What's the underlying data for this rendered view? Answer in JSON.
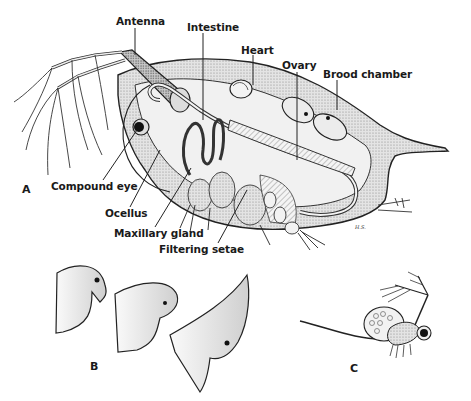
{
  "figure": {
    "panels": [
      {
        "letter": "A",
        "description": "Lateral view of adult water flea showing internal anatomy"
      },
      {
        "letter": "B",
        "description": "Three head shapes (cyclomorphosis)"
      },
      {
        "letter": "C",
        "description": "Small individual with antennae and long tail spine"
      }
    ]
  },
  "labels": {
    "antenna": "Antenna",
    "intestine": "Intestine",
    "heart": "Heart",
    "ovary": "Ovary",
    "brood_chamber": "Brood chamber",
    "compound_eye": "Compound eye",
    "ocellus": "Ocellus",
    "maxillary_gland": "Maxillary gland",
    "filtering_setae": "Filtering setae"
  },
  "panel_letters": {
    "a": "A",
    "b": "B",
    "c": "C"
  },
  "signature": "H.S."
}
